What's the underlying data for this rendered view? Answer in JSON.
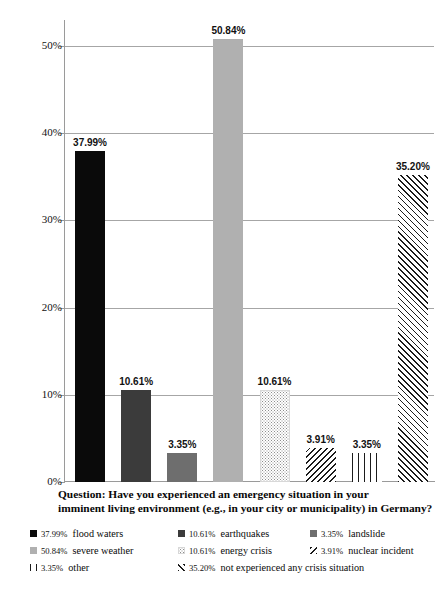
{
  "chart_data": {
    "type": "bar",
    "title": "",
    "subtitle": "",
    "xlabel": "",
    "ylabel": "",
    "ylim": [
      0,
      53
    ],
    "grid": true,
    "legend_position": "bottom",
    "categories": [
      "flood waters",
      "earthquakes",
      "landslide",
      "severe weather",
      "energy crisis",
      "nuclear incident",
      "other",
      "not experienced any crisis situation"
    ],
    "values": [
      37.99,
      10.61,
      3.35,
      50.84,
      10.61,
      3.91,
      3.35,
      35.2
    ],
    "value_labels": [
      "37.99%",
      "10.61%",
      "3.35%",
      "50.84%",
      "10.61%",
      "3.91%",
      "3.35%",
      "35.20%"
    ],
    "patterns": [
      "solid-black",
      "dark-gray",
      "mid-gray",
      "light-gray",
      "dots",
      "hatch-backward",
      "vertical-lines",
      "hatch-forward"
    ],
    "ytick_labels": [
      "50%",
      "40%",
      "30%",
      "20%",
      "10%",
      "0%"
    ],
    "ytick_values": [
      50,
      40,
      30,
      20,
      10,
      0
    ]
  },
  "question": {
    "line1": "Question: Have you experienced an emergency situation in your",
    "line2": "imminent living environment (e.g., in your city or municipality) in Germany?"
  },
  "legend": {
    "rows": [
      [
        {
          "pct": "37.99%",
          "label": "flood waters",
          "pattern": "solid-black"
        },
        {
          "pct": "10.61%",
          "label": "earthquakes",
          "pattern": "dark-gray"
        },
        {
          "pct": "3.35%",
          "label": "landslide",
          "pattern": "mid-gray"
        }
      ],
      [
        {
          "pct": "50.84%",
          "label": "severe weather",
          "pattern": "light-gray"
        },
        {
          "pct": "10.61%",
          "label": "energy crisis",
          "pattern": "dots"
        },
        {
          "pct": "3.91%",
          "label": "nuclear incident",
          "pattern": "hatch-backward"
        }
      ],
      [
        {
          "pct": "3.35%",
          "label": "other",
          "pattern": "vertical-lines"
        },
        {
          "pct": "35.20%",
          "label": "not experienced any crisis situation",
          "pattern": "hatch-forward"
        }
      ]
    ]
  },
  "colors": {
    "solid_black": "#0a0a0a",
    "dark_gray": "#3b3b3b",
    "mid_gray": "#6e6e6e",
    "light_gray": "#b0b0b0",
    "gridline": "#a6a6a6",
    "background": "#ffffff"
  }
}
